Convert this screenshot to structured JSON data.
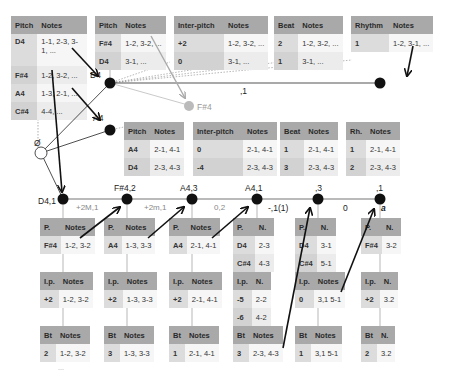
{
  "top_tables": {
    "pitch_main": {
      "headers": [
        "Pitch",
        "Notes"
      ],
      "rows": [
        [
          "D4",
          "1-1, 2-3, 3-1, ..."
        ],
        [
          "F#4",
          "1-2, 3-2, ..."
        ],
        [
          "A4",
          "1-3, 2-1, ..."
        ],
        [
          "C#4",
          "4-4, ..."
        ]
      ]
    },
    "pitch_d4": {
      "headers": [
        "Pitch",
        "Notes"
      ],
      "rows": [
        [
          "F#4",
          "1-2, 3-2, ..."
        ],
        [
          "D4",
          "3-1, ..."
        ]
      ]
    },
    "interpitch_d4": {
      "headers": [
        "Inter-pitch",
        "Notes"
      ],
      "rows": [
        [
          "+2",
          "1-2, 3-2, ..."
        ],
        [
          "0",
          "3-1, ..."
        ]
      ]
    },
    "beat_d4": {
      "headers": [
        "Beat",
        "Notes"
      ],
      "rows": [
        [
          "2",
          "1-2, 3-2, ..."
        ],
        [
          "1",
          "3-1, ..."
        ]
      ]
    },
    "rhythm_d4": {
      "headers": [
        "Rhythm",
        "Notes"
      ],
      "rows": [
        [
          "1",
          "1-2, 3-1, ..."
        ]
      ]
    }
  },
  "mid_tables": {
    "pitch_a4": {
      "headers": [
        "Pitch",
        "Notes"
      ],
      "rows": [
        [
          "A4",
          "2-1, 4-1"
        ],
        [
          "D4",
          "2-3, 4-3"
        ]
      ]
    },
    "interpitch_a4": {
      "headers": [
        "Inter-pitch",
        "Notes"
      ],
      "rows": [
        [
          "0",
          "2-1, 4-1"
        ],
        [
          "-4",
          "2-3, 4-3"
        ]
      ]
    },
    "beat_a4": {
      "headers": [
        "Beat",
        "Notes"
      ],
      "rows": [
        [
          "1",
          "2-1, 4-1"
        ],
        [
          "3",
          "2-3, 4-3"
        ]
      ]
    },
    "rh_a4": {
      "headers": [
        "Rh.",
        "Notes"
      ],
      "rows": [
        [
          "1",
          "2-1, 4-1"
        ],
        [
          "2",
          "2-3, 4-3"
        ]
      ]
    }
  },
  "nodes": {
    "root": "Ø",
    "d4_top": "D4",
    "f4_grey": "F#4",
    "a4_mid": "A4",
    "top_edge": ",1",
    "chain": [
      "D4,1",
      "F#4,2",
      "A4,3",
      "A4,1",
      ",3",
      ",1"
    ],
    "chain_edges": [
      "+2M,1",
      "+2m,1",
      "0,2",
      "-,1(1)",
      "0"
    ],
    "end_marker": "a"
  },
  "chain_tables": [
    {
      "p": {
        "headers": [
          "P.",
          "Notes"
        ],
        "rows": [
          [
            "F#4",
            "1-2, 3-2"
          ]
        ]
      },
      "ip": {
        "headers": [
          "I.p.",
          "Notes"
        ],
        "rows": [
          [
            "+2",
            "1-2, 3-2"
          ]
        ]
      },
      "bt": {
        "headers": [
          "Bt",
          "Notes"
        ],
        "rows": [
          [
            "2",
            "1-2, 3-2"
          ]
        ]
      }
    },
    {
      "p": {
        "headers": [
          "P.",
          "Notes"
        ],
        "rows": [
          [
            "A4",
            "1-3, 3-3"
          ]
        ]
      },
      "ip": {
        "headers": [
          "I.p.",
          "Notes"
        ],
        "rows": [
          [
            "+2",
            "1-3, 3-3"
          ]
        ]
      },
      "bt": {
        "headers": [
          "Bt",
          "Notes"
        ],
        "rows": [
          [
            "3",
            "1-3, 3-3"
          ]
        ]
      }
    },
    {
      "p": {
        "headers": [
          "P.",
          "Notes"
        ],
        "rows": [
          [
            "A4",
            "2-1, 4-1"
          ]
        ]
      },
      "ip": {
        "headers": [
          "I.p.",
          "Notes"
        ],
        "rows": [
          [
            "+2",
            "2-1, 4-1"
          ]
        ]
      },
      "bt": {
        "headers": [
          "Bt",
          "Notes"
        ],
        "rows": [
          [
            "1",
            "2-1, 4-1"
          ]
        ]
      }
    },
    {
      "p": {
        "headers": [
          "P.",
          "N."
        ],
        "rows": [
          [
            "D4",
            "2-3"
          ],
          [
            "C#4",
            "4-3"
          ]
        ]
      },
      "ip": {
        "headers": [
          "I.p.",
          "N."
        ],
        "rows": [
          [
            "-5",
            "2-2"
          ],
          [
            "-6",
            "4-2"
          ]
        ]
      },
      "bt": {
        "headers": [
          "Bt",
          "Notes"
        ],
        "rows": [
          [
            "3",
            "2-3, 4-3"
          ]
        ]
      }
    },
    {
      "p": {
        "headers": [
          "P.",
          "N."
        ],
        "rows": [
          [
            "D4",
            "3-1"
          ],
          [
            "C#4",
            "5-1"
          ]
        ]
      },
      "ip": {
        "headers": [
          "I.p.",
          "Notes"
        ],
        "rows": [
          [
            "0",
            "3,1 5-1"
          ]
        ]
      },
      "bt": {
        "headers": [
          "Bt",
          "Notes"
        ],
        "rows": [
          [
            "1",
            "3,1 5-1"
          ]
        ]
      }
    },
    {
      "p": {
        "headers": [
          "P.",
          "N."
        ],
        "rows": [
          [
            "F#4",
            "3-2"
          ]
        ]
      },
      "ip": {
        "headers": [
          "I.p.",
          "N."
        ],
        "rows": [
          [
            "+2",
            "3.2"
          ]
        ]
      },
      "bt": {
        "headers": [
          "Bt",
          "N."
        ],
        "rows": [
          [
            "2",
            "3.2"
          ]
        ]
      }
    }
  ],
  "ellipsis": "..."
}
